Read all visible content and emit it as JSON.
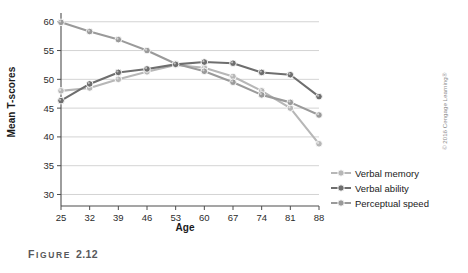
{
  "figure": {
    "caption_label": "F",
    "caption_word": "IGURE",
    "caption_number": "2.12",
    "caption_full": "FIGURE 2.12",
    "copyright": "© 2016 Cengage Learning®"
  },
  "chart_data": {
    "type": "line",
    "title": "",
    "xlabel": "Age",
    "ylabel": "Mean T-scores",
    "categories": [
      "25",
      "32",
      "39",
      "46",
      "53",
      "60",
      "67",
      "74",
      "81",
      "88"
    ],
    "x": [
      25,
      32,
      39,
      46,
      53,
      60,
      67,
      74,
      81,
      88
    ],
    "ylim": [
      28,
      61
    ],
    "yticks": [
      30,
      35,
      40,
      45,
      50,
      55,
      60
    ],
    "grid": "horizontal",
    "legend_position": "bottom-right",
    "series": [
      {
        "name": "Verbal memory",
        "color": "#b7b7b7",
        "values": [
          48.0,
          48.5,
          50.0,
          51.3,
          52.5,
          52.0,
          50.5,
          48.0,
          45.0,
          38.8
        ]
      },
      {
        "name": "Verbal ability",
        "color": "#6e6e6e",
        "values": [
          46.3,
          49.2,
          51.2,
          51.8,
          52.6,
          53.0,
          52.8,
          51.2,
          50.8,
          47.0
        ]
      },
      {
        "name": "Perceptual speed",
        "color": "#9a9a9a",
        "values": [
          59.9,
          58.3,
          56.9,
          55.0,
          52.7,
          51.4,
          49.5,
          47.3,
          46.0,
          43.8
        ]
      }
    ]
  },
  "legend": {
    "items": [
      {
        "label": "Verbal memory"
      },
      {
        "label": "Verbal ability"
      },
      {
        "label": "Perceptual speed"
      }
    ]
  },
  "colors": {
    "axis": "#4d4d4d",
    "grid": "#c8c8c8",
    "verbal_memory": "#b7b7b7",
    "verbal_ability": "#6e6e6e",
    "perceptual_speed": "#9a9a9a",
    "caption": "#58595b"
  }
}
